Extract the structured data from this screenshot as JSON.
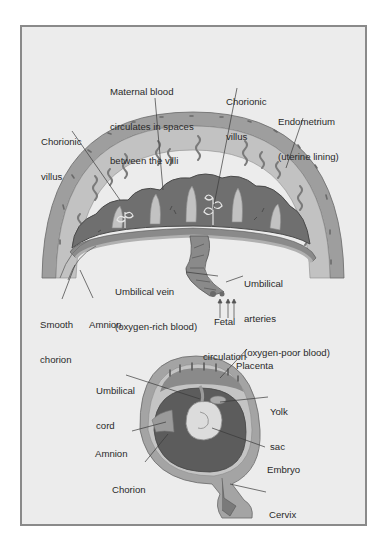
{
  "figure": {
    "top_panel": {
      "name": "placenta-cross-section",
      "labels": {
        "maternal_blood": [
          "Maternal blood",
          "circulates in spaces",
          "between the villi"
        ],
        "chorionic_villus_center": [
          "Chorionic",
          "villus"
        ],
        "endometrium": [
          "Endometrium",
          "(uterine lining)"
        ],
        "chorionic_villus_left": [
          "Chorionic",
          "villus"
        ],
        "umbilical_vein": [
          "Umbilical vein",
          "(oxygen-rich blood)"
        ],
        "umbilical_arteries": [
          "Umbilical",
          "arteries",
          "(oxygen-poor blood)"
        ],
        "smooth_chorion": [
          "Smooth",
          "chorion"
        ],
        "amnion": [
          "Amnion"
        ],
        "fetal_circulation": [
          "Fetal",
          "circulation"
        ]
      }
    },
    "bottom_panel": {
      "name": "uterus-with-embryo",
      "labels": {
        "placenta": [
          "Placenta"
        ],
        "umbilical_cord": [
          "Umbilical",
          "cord"
        ],
        "yolk_sac": [
          "Yolk",
          "sac"
        ],
        "amnion": [
          "Amnion"
        ],
        "embryo": [
          "Embryo"
        ],
        "chorion": [
          "Chorion"
        ],
        "cervix": [
          "Cervix"
        ]
      }
    },
    "colors": {
      "background": "#ececec",
      "frame_border": "#8a8a8a",
      "endometrium": "#b9b9b9",
      "placenta_dark": "#6f6f6f",
      "amniotic_cavity": "#5c5c5c",
      "embryo": "#d9d9d9",
      "label_text": "#2a2a2a"
    }
  }
}
